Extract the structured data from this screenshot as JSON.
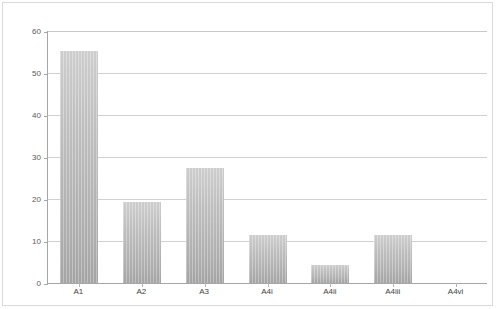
{
  "chart_data": {
    "type": "bar",
    "title": "",
    "xlabel": "",
    "ylabel": "",
    "categories": [
      "A1",
      "A2",
      "A3",
      "A4i",
      "A4ii",
      "A4iii",
      "A4vi"
    ],
    "values": [
      55.2,
      19.2,
      27.3,
      11.4,
      4.3,
      11.5,
      0
    ],
    "ylim": [
      0,
      60
    ],
    "yticks": [
      0,
      10,
      20,
      30,
      40,
      50,
      60
    ],
    "ytick_labels": [
      "0",
      "10",
      "20",
      "30",
      "40",
      "50",
      "60"
    ],
    "grid": true,
    "grid_axis": "y",
    "legend": false,
    "legend_position": "none",
    "bar_color": "#c0c0c0",
    "gridline_color": "#d0d0d0",
    "axis_color": "#a6a6a6",
    "tick_label_color": "#595959",
    "background_color": "#ffffff"
  }
}
